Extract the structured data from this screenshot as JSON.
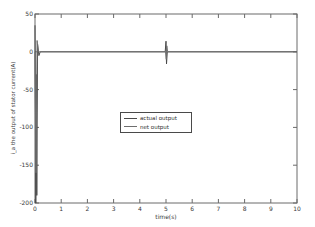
{
  "figure": {
    "background_color": "#ffffff",
    "axis_color": "#6a6a6a",
    "tick_label_color": "#3a3a3a"
  },
  "chart_data": {
    "type": "line",
    "title": "",
    "xlabel": "time(s)",
    "ylabel": "i_a the output of stator current(A)",
    "xlim": [
      0,
      10
    ],
    "ylim": [
      -200,
      50
    ],
    "xticks": [
      0,
      1,
      2,
      3,
      4,
      5,
      6,
      7,
      8,
      9,
      10
    ],
    "yticks": [
      50,
      0,
      -50,
      -100,
      -150,
      -200
    ],
    "grid": false,
    "legend_position": "center",
    "series": [
      {
        "name": "actual output",
        "color": "#4a4a4a",
        "points": [
          [
            0,
            35
          ],
          [
            0.03,
            -200
          ],
          [
            0.05,
            -30
          ],
          [
            0.07,
            -190
          ],
          [
            0.1,
            10
          ],
          [
            0.15,
            -5
          ],
          [
            0.2,
            0
          ],
          [
            4.97,
            0
          ],
          [
            5.0,
            14
          ],
          [
            5.02,
            -16
          ],
          [
            5.05,
            0
          ],
          [
            10,
            0
          ]
        ]
      },
      {
        "name": "net output",
        "color": "#6e6e6e",
        "points": [
          [
            0,
            0
          ],
          [
            0.04,
            -160
          ],
          [
            0.08,
            15
          ],
          [
            0.12,
            0
          ],
          [
            4.98,
            0
          ],
          [
            5.01,
            -10
          ],
          [
            5.03,
            8
          ],
          [
            5.06,
            0
          ],
          [
            10,
            0
          ]
        ]
      }
    ]
  }
}
